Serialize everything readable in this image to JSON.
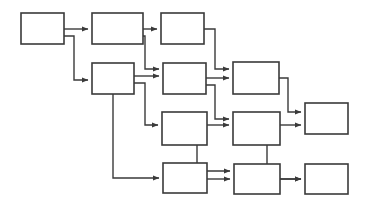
{
  "diagram": {
    "type": "flowchart",
    "background_color": "#ffffff",
    "node_fill": "#ffffff",
    "node_stroke": "#3a3a3a",
    "node_stroke_width": 1.6,
    "edge_stroke": "#3a3a3a",
    "edge_stroke_width": 1.4,
    "arrowhead": "filled-triangle",
    "nodes": [
      {
        "id": "n1",
        "label": "",
        "x": 21,
        "y": 13,
        "w": 43,
        "h": 31,
        "row": 1,
        "col": 1
      },
      {
        "id": "n2",
        "label": "",
        "x": 92,
        "y": 13,
        "w": 51,
        "h": 31,
        "row": 1,
        "col": 2
      },
      {
        "id": "n3",
        "label": "",
        "x": 161,
        "y": 13,
        "w": 43,
        "h": 31,
        "row": 1,
        "col": 3
      },
      {
        "id": "n4",
        "label": "",
        "x": 92,
        "y": 63,
        "w": 42,
        "h": 31,
        "row": 2,
        "col": 2
      },
      {
        "id": "n5",
        "label": "",
        "x": 163,
        "y": 63,
        "w": 43,
        "h": 31,
        "row": 2,
        "col": 3
      },
      {
        "id": "n6",
        "label": "",
        "x": 233,
        "y": 62,
        "w": 46,
        "h": 32,
        "row": 2,
        "col": 4
      },
      {
        "id": "n7",
        "label": "",
        "x": 162,
        "y": 112,
        "w": 45,
        "h": 33,
        "row": 3,
        "col": 3
      },
      {
        "id": "n8",
        "label": "",
        "x": 233,
        "y": 112,
        "w": 47,
        "h": 33,
        "row": 3,
        "col": 4
      },
      {
        "id": "n9",
        "label": "",
        "x": 305,
        "y": 103,
        "w": 43,
        "h": 31,
        "row": 3,
        "col": 5
      },
      {
        "id": "n10",
        "label": "",
        "x": 163,
        "y": 163,
        "w": 44,
        "h": 30,
        "row": 4,
        "col": 3
      },
      {
        "id": "n11",
        "label": "",
        "x": 234,
        "y": 164,
        "w": 46,
        "h": 30,
        "row": 4,
        "col": 4
      },
      {
        "id": "n12",
        "label": "",
        "x": 305,
        "y": 164,
        "w": 43,
        "h": 30,
        "row": 4,
        "col": 5
      }
    ],
    "edges": [
      {
        "id": "e1",
        "from": "n1",
        "to": "n2",
        "label": "",
        "points": "64,29 88,29"
      },
      {
        "id": "e2",
        "from": "n1",
        "to": "n4",
        "label": "",
        "points": "64,36 74,36 74,80 88,80"
      },
      {
        "id": "e3",
        "from": "n2",
        "to": "n3",
        "label": "",
        "points": "143,29 157,29"
      },
      {
        "id": "e4",
        "from": "n2",
        "to": "n5",
        "label": "",
        "points": "143,36 145,36 145,69 159,69"
      },
      {
        "id": "e5",
        "from": "n3",
        "to": "n6",
        "label": "",
        "points": "204,29 215,29 215,69 229,69"
      },
      {
        "id": "e6",
        "from": "n4",
        "to": "n5",
        "label": "",
        "points": "134,76 159,76"
      },
      {
        "id": "e7",
        "from": "n4",
        "to": "n7",
        "label": "",
        "points": "134,83 145,83 145,125 158,125"
      },
      {
        "id": "e8",
        "from": "n4",
        "to": "n10",
        "label": "",
        "points": "113,94 113,178 159,178"
      },
      {
        "id": "e9",
        "from": "n5",
        "to": "n6",
        "label": "",
        "points": "206,78 229,78"
      },
      {
        "id": "e10",
        "from": "n5",
        "to": "n8",
        "label": "",
        "points": "206,85 215,85 215,119 229,119"
      },
      {
        "id": "e11",
        "from": "n6",
        "to": "n9",
        "label": "",
        "points": "279,78 288,78 288,112 301,112"
      },
      {
        "id": "e12",
        "from": "n7",
        "to": "n8",
        "label": "",
        "points": "207,125 229,125"
      },
      {
        "id": "e13",
        "from": "n7",
        "to": "n11",
        "label": "",
        "points": "197,145 197,171 230,171"
      },
      {
        "id": "e14",
        "from": "n8",
        "to": "n9",
        "label": "",
        "points": "280,125 301,125"
      },
      {
        "id": "e15",
        "from": "n8",
        "to": "n12",
        "label": "",
        "points": "267,145 267,179 301,179"
      },
      {
        "id": "e16",
        "from": "n10",
        "to": "n11",
        "label": "",
        "points": "207,179 230,179"
      },
      {
        "id": "e17",
        "from": "n11",
        "to": "n12",
        "label": "",
        "points": "280,179 301,179"
      }
    ]
  }
}
